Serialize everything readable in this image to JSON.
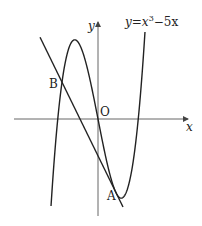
{
  "figure": {
    "equation_label": {
      "y": "y",
      "eq": "=",
      "x": "x",
      "exp": "3",
      "rest": "−5x"
    },
    "axis_labels": {
      "x": "x",
      "y": "y"
    },
    "origin_label": "O",
    "points": [
      {
        "name": "A",
        "label": "A",
        "x": 1,
        "y": -4
      },
      {
        "name": "B",
        "label": "B",
        "x": -2,
        "y": 2
      }
    ],
    "curve": {
      "equation": "y = x^3 - 5x",
      "x_range": [
        -2.61,
        2.61
      ]
    },
    "line": {
      "equation": "y = -2x - 2",
      "x_range": [
        -3.22,
        1.39
      ],
      "note": "tangent to curve at A, meets curve again at B"
    },
    "colors": {
      "stroke": "#222222",
      "axis": "#555555",
      "background": "#ffffff"
    }
  }
}
